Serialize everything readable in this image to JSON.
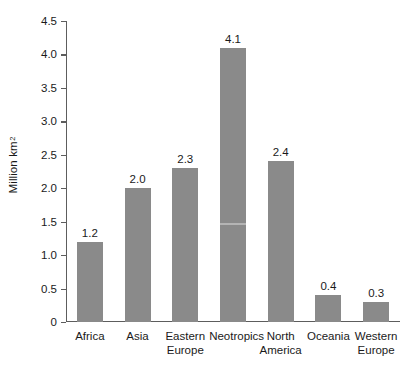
{
  "chart_data": {
    "type": "bar",
    "title": "",
    "xlabel": "",
    "ylabel": "Million km",
    "ylabel_superscript": "2",
    "categories": [
      "Africa",
      "Asia",
      "Eastern Europe",
      "Neotropics",
      "North America",
      "Oceania",
      "Western Europe"
    ],
    "values": [
      1.2,
      2.0,
      2.3,
      4.1,
      2.4,
      0.4,
      0.3
    ],
    "value_labels": [
      "1.2",
      "2.0",
      "2.3",
      "4.1",
      "2.4",
      "0.4",
      "0.3"
    ],
    "ylim": [
      0,
      4.5
    ],
    "yticks": [
      0,
      0.5,
      1.0,
      1.5,
      2.0,
      2.5,
      3.0,
      3.5,
      4.0,
      4.5
    ],
    "ytick_labels": [
      "0",
      "0.5",
      "1.0",
      "1.5",
      "2.0",
      "2.5",
      "3.0",
      "3.5",
      "4.0",
      "4.5"
    ],
    "grid": false,
    "legend": false,
    "bar_color": "#8a8a8a",
    "axis_color": "#5d5d5d",
    "background": "#ffffff"
  }
}
